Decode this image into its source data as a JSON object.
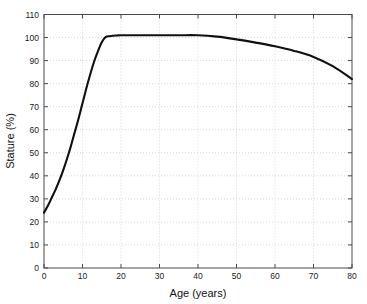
{
  "chart_data": {
    "type": "line",
    "title": "",
    "xlabel": "Age (years)",
    "ylabel": "Stature (%)",
    "xlim": [
      0,
      80
    ],
    "ylim": [
      0,
      110
    ],
    "xticks": [
      0,
      10,
      20,
      30,
      40,
      50,
      60,
      70,
      80
    ],
    "yticks": [
      0,
      10,
      20,
      30,
      40,
      50,
      60,
      70,
      80,
      90,
      100,
      110
    ],
    "grid": true,
    "legend": null,
    "series": [
      {
        "name": "Stature",
        "color": "#101010",
        "x": [
          0,
          1,
          2,
          3,
          4,
          5,
          6,
          7,
          8,
          9,
          10,
          11,
          12,
          13,
          14,
          15,
          16,
          17,
          18,
          19,
          20,
          25,
          30,
          35,
          40,
          45,
          50,
          55,
          60,
          65,
          70,
          75,
          80
        ],
        "y": [
          24,
          27,
          30.5,
          34,
          38,
          42.5,
          47.5,
          53,
          59,
          65,
          71.5,
          78,
          84,
          89.5,
          94,
          98,
          100.2,
          100.6,
          100.8,
          100.9,
          101,
          101,
          101,
          101,
          101,
          100.4,
          99.2,
          97.8,
          96.2,
          94.2,
          91.6,
          87.6,
          82
        ]
      }
    ]
  },
  "axes": {
    "x_tick_labels": [
      "0",
      "10",
      "20",
      "30",
      "40",
      "50",
      "60",
      "70",
      "80"
    ],
    "y_tick_labels": [
      "0",
      "10",
      "20",
      "30",
      "40",
      "50",
      "60",
      "70",
      "80",
      "90",
      "100",
      "110"
    ],
    "x_axis_title": "Age (years)",
    "y_axis_title": "Stature (%)"
  },
  "colors": {
    "curve": "#101010",
    "grid": "#c9c9c9",
    "axis": "#4a4a4a",
    "background": "#ffffff",
    "text": "#1a1a1a"
  }
}
